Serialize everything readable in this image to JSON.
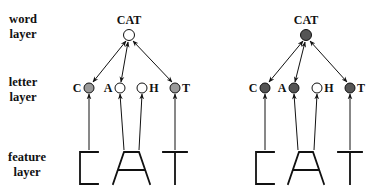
{
  "layer_labels": {
    "word": [
      "word",
      "layer"
    ],
    "letter": [
      "letter",
      "layer"
    ],
    "feature": [
      "feature",
      "layer"
    ]
  },
  "colors": {
    "active_left": "#9a9a9a",
    "active_right": "#555555",
    "inactive": "#ffffff",
    "stroke": "#111111"
  },
  "panels": [
    {
      "id": "left",
      "word_node": {
        "label": "CAT",
        "state": "inactive"
      },
      "letter_nodes": [
        {
          "label": "C",
          "state": "active"
        },
        {
          "label": "A",
          "state": "inactive"
        },
        {
          "label": "H",
          "state": "inactive"
        },
        {
          "label": "T",
          "state": "active"
        }
      ],
      "feature_letters": [
        "C",
        "A",
        "T"
      ]
    },
    {
      "id": "right",
      "word_node": {
        "label": "CAT",
        "state": "active"
      },
      "letter_nodes": [
        {
          "label": "C",
          "state": "active"
        },
        {
          "label": "A",
          "state": "active"
        },
        {
          "label": "H",
          "state": "inactive"
        },
        {
          "label": "T",
          "state": "active"
        }
      ],
      "feature_letters": [
        "C",
        "A",
        "T"
      ]
    }
  ]
}
